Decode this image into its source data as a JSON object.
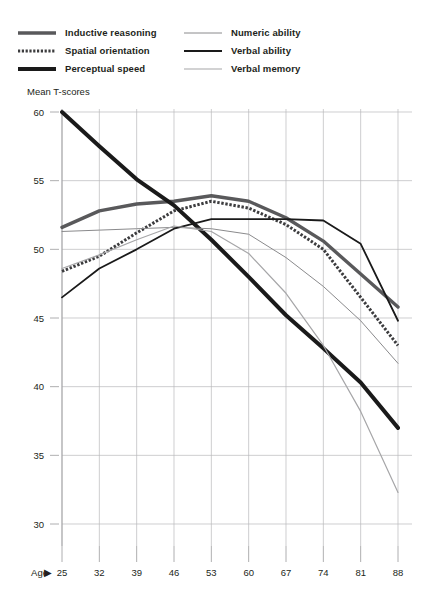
{
  "legend": {
    "columns": [
      {
        "items": [
          {
            "label": "Inductive  reasoning",
            "style": "thick-solid",
            "color": "#59595b",
            "width": 3.4,
            "icon": "line-swatch-icon"
          },
          {
            "label": "Spatial orientation",
            "style": "dotted",
            "color": "#3c3c3e",
            "width": 3.0,
            "icon": "dotted-line-swatch-icon"
          },
          {
            "label": "Perceptual speed",
            "style": "extra-thick",
            "color": "#1a1a1a",
            "width": 4.0,
            "icon": "line-swatch-icon"
          }
        ]
      },
      {
        "items": [
          {
            "label": "Numeric ability",
            "style": "thin-solid",
            "color": "#8a8a8c",
            "width": 1.0,
            "icon": "line-swatch-icon"
          },
          {
            "label": "Verbal ability",
            "style": "medium-solid",
            "color": "#1a1a1a",
            "width": 1.8,
            "icon": "line-swatch-icon"
          },
          {
            "label": "Verbal memory",
            "style": "thin-grey",
            "color": "#a6a6a8",
            "width": 1.2,
            "icon": "line-swatch-icon"
          }
        ]
      }
    ]
  },
  "axis": {
    "y_title": "Mean T-scores",
    "x_name": "Age",
    "x_arrow": "▶"
  },
  "chart_data": {
    "type": "line",
    "title": "",
    "xlabel": "Age",
    "ylabel": "Mean T-scores",
    "x": [
      25,
      32,
      39,
      46,
      53,
      60,
      67,
      74,
      81,
      88
    ],
    "categories": [
      "25",
      "32",
      "39",
      "46",
      "53",
      "60",
      "67",
      "74",
      "81",
      "88"
    ],
    "xlim": [
      25,
      88
    ],
    "ylim": [
      28.5,
      61
    ],
    "yticks": [
      60,
      55,
      50,
      45,
      40,
      35,
      30
    ],
    "xticks": [
      25,
      32,
      39,
      46,
      53,
      60,
      67,
      74,
      81,
      88
    ],
    "grid": true,
    "legend_position": "top-left",
    "series": [
      {
        "name": "Inductive  reasoning",
        "color": "#59595b",
        "width": 3.4,
        "dash": "none",
        "values": [
          51.6,
          52.8,
          53.3,
          53.5,
          53.9,
          53.5,
          52.3,
          50.6,
          48.2,
          45.8
        ]
      },
      {
        "name": "Spatial orientation",
        "color": "#3c3c3e",
        "width": 3.0,
        "dash": "dotted",
        "values": [
          48.4,
          49.5,
          51.2,
          52.8,
          53.5,
          53.0,
          51.8,
          50.0,
          46.5,
          43.0
        ]
      },
      {
        "name": "Perceptual speed",
        "color": "#1a1a1a",
        "width": 4.0,
        "dash": "none",
        "values": [
          60.0,
          57.5,
          55.1,
          53.2,
          50.7,
          48.0,
          45.2,
          42.8,
          40.3,
          37.0
        ]
      },
      {
        "name": "Numeric ability",
        "color": "#8a8a8c",
        "width": 1.0,
        "dash": "none",
        "values": [
          51.3,
          51.4,
          51.5,
          51.6,
          51.5,
          51.1,
          49.4,
          47.3,
          44.8,
          41.7
        ]
      },
      {
        "name": "Verbal ability",
        "color": "#1a1a1a",
        "width": 1.8,
        "dash": "none",
        "values": [
          46.5,
          48.6,
          50.0,
          51.5,
          52.2,
          52.2,
          52.2,
          52.1,
          50.4,
          44.8
        ]
      },
      {
        "name": "Verbal memory",
        "color": "#a6a6a8",
        "width": 1.2,
        "dash": "none",
        "values": [
          48.6,
          49.6,
          50.7,
          51.7,
          51.3,
          49.7,
          46.8,
          43.0,
          38.2,
          32.3
        ]
      }
    ]
  }
}
